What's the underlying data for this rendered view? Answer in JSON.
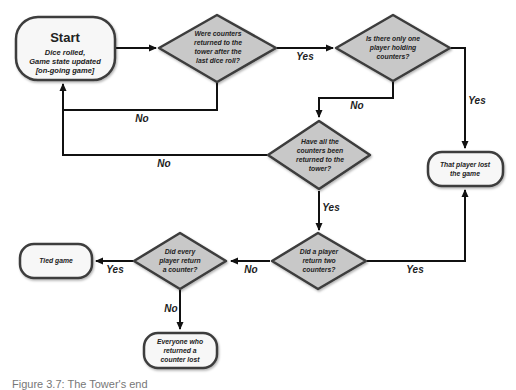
{
  "colors": {
    "decision_fill": "#c8c8c8",
    "terminal_fill": "#f7f7f7",
    "stroke": "#3c3c3c",
    "edge": "#111111",
    "text": "#222222"
  },
  "nodes": {
    "start": {
      "type": "terminal",
      "title": "Start",
      "lines": [
        "Dice rolled,",
        "Game state updated",
        "[on-going game]"
      ]
    },
    "q_counters_returned": {
      "type": "decision",
      "lines": [
        "Were counters",
        "returned to the",
        "tower after the",
        "last dice roll?"
      ]
    },
    "q_one_player": {
      "type": "decision",
      "lines": [
        "Is there only one",
        "player holding",
        "counters?"
      ]
    },
    "q_all_returned": {
      "type": "decision",
      "lines": [
        "Have all the",
        "counters been",
        "returned to the",
        "tower?"
      ]
    },
    "q_two_counters": {
      "type": "decision",
      "lines": [
        "Did a player",
        "return two",
        "counters?"
      ]
    },
    "q_every_player": {
      "type": "decision",
      "lines": [
        "Did every",
        "player return",
        "a counter?"
      ]
    },
    "end_player_lost": {
      "type": "terminal",
      "lines": [
        "That player lost",
        "the game"
      ]
    },
    "end_tied": {
      "type": "terminal",
      "lines": [
        "Tied game"
      ]
    },
    "end_everyone_lost": {
      "type": "terminal",
      "lines": [
        "Everyone who",
        "returned a",
        "counter lost"
      ]
    }
  },
  "edges": {
    "start_to_q1": "",
    "q1_yes": "Yes",
    "q1_no": "No",
    "q2_yes": "Yes",
    "q2_no": "No",
    "q3_no": "No",
    "q3_yes": "Yes",
    "q4_yes": "Yes",
    "q4_no": "No",
    "q5_yes": "Yes",
    "q5_no": "No"
  },
  "caption": "Figure 3.7: The Tower's end"
}
